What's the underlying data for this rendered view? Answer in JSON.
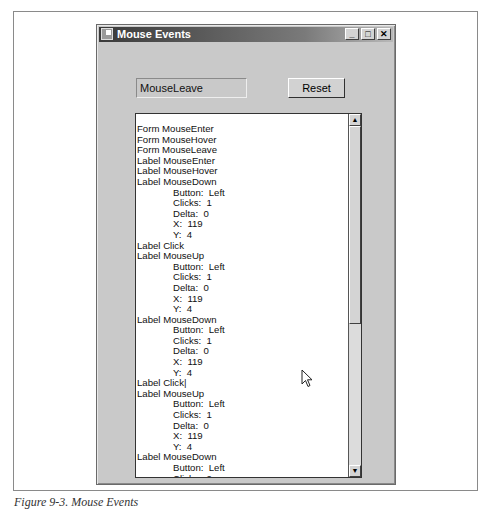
{
  "window": {
    "title": "Mouse Events",
    "controls": {
      "minimize": "_",
      "maximize": "□",
      "close": "✕"
    }
  },
  "status_label": "MouseLeave",
  "reset_button": "Reset",
  "event_log": [
    {
      "text": "Form MouseEnter",
      "indent": false
    },
    {
      "text": "Form MouseHover",
      "indent": false
    },
    {
      "text": "Form MouseLeave",
      "indent": false
    },
    {
      "text": "Label MouseEnter",
      "indent": false
    },
    {
      "text": "Label MouseHover",
      "indent": false
    },
    {
      "text": "Label MouseDown",
      "indent": false
    },
    {
      "text": "Button:  Left",
      "indent": true
    },
    {
      "text": "Clicks:  1",
      "indent": true
    },
    {
      "text": "Delta:  0",
      "indent": true
    },
    {
      "text": "X:  119",
      "indent": true
    },
    {
      "text": "Y:  4",
      "indent": true
    },
    {
      "text": "Label Click",
      "indent": false
    },
    {
      "text": "Label MouseUp",
      "indent": false
    },
    {
      "text": "Button:  Left",
      "indent": true
    },
    {
      "text": "Clicks:  1",
      "indent": true
    },
    {
      "text": "Delta:  0",
      "indent": true
    },
    {
      "text": "X:  119",
      "indent": true
    },
    {
      "text": "Y:  4",
      "indent": true
    },
    {
      "text": "Label MouseDown",
      "indent": false
    },
    {
      "text": "Button:  Left",
      "indent": true
    },
    {
      "text": "Clicks:  1",
      "indent": true
    },
    {
      "text": "Delta:  0",
      "indent": true
    },
    {
      "text": "X:  119",
      "indent": true
    },
    {
      "text": "Y:  4",
      "indent": true
    },
    {
      "text": "Label Click|",
      "indent": false
    },
    {
      "text": "Label MouseUp",
      "indent": false
    },
    {
      "text": "Button:  Left",
      "indent": true
    },
    {
      "text": "Clicks:  1",
      "indent": true
    },
    {
      "text": "Delta:  0",
      "indent": true
    },
    {
      "text": "X:  119",
      "indent": true
    },
    {
      "text": "Y:  4",
      "indent": true
    },
    {
      "text": "Label MouseDown",
      "indent": false
    },
    {
      "text": "Button:  Left",
      "indent": true
    },
    {
      "text": "Clicks:  2",
      "indent": true
    },
    {
      "text": "Delta:  0",
      "indent": true
    }
  ],
  "scrollbar": {
    "up": "▲",
    "down": "▼"
  },
  "caption": "Figure 9-3. Mouse Events"
}
